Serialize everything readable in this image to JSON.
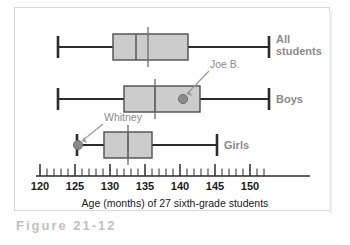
{
  "figure": {
    "caption_label": "Figure 21-12",
    "axis_title": "Age (months) of 27 sixth-grade students"
  },
  "chart_data": {
    "type": "box",
    "title": "",
    "xlabel": "Age (months) of 27 sixth-grade students",
    "ylabel": "",
    "xlim": [
      120,
      152.5
    ],
    "xticks": [
      120,
      125,
      130,
      135,
      140,
      145,
      150
    ],
    "xtick_labels": [
      "120",
      "125",
      "130",
      "135",
      "140",
      "145",
      "150"
    ],
    "minor_tick_step": 1,
    "grid": false,
    "orientation": "horizontal",
    "legend": "none",
    "n": 27,
    "categories": [
      "All students",
      "Boys",
      "Girls"
    ],
    "boxes": [
      {
        "name": "All students",
        "label": "All\nstudents",
        "label_line1": "All",
        "label_line2": "students",
        "whisker_low": 122.6,
        "q1": 130.4,
        "median": 133.7,
        "q3": 141.1,
        "whisker_high": 152.7,
        "mean": 135.4
      },
      {
        "name": "Boys",
        "label": "Boys",
        "whisker_low": 122.6,
        "q1": 132.0,
        "median": 136.4,
        "q3": 142.9,
        "whisker_high": 152.7,
        "mean": 136.4
      },
      {
        "name": "Girls",
        "label": "Girls",
        "whisker_low": 125.3,
        "q1": 129.1,
        "median": 132.6,
        "q3": 136.0,
        "whisker_high": 145.3,
        "mean": 133.4
      }
    ],
    "annotations": [
      {
        "name": "joe-b",
        "text": "Joe B.",
        "series": "Boys",
        "value": 140.4
      },
      {
        "name": "whitney",
        "text": "Whitney",
        "series": "Girls",
        "value": 125.3
      }
    ],
    "colors": {
      "box_fill": "#cccccc",
      "box_stroke": "#4d4d4d",
      "line": "#2b2b2b",
      "point": "#8a8a8a",
      "annotation_text": "#8a8a8a",
      "category_label": "#8a8a8a",
      "axis": "#2b2b2b",
      "tick_label": "#1a1a1a"
    }
  }
}
